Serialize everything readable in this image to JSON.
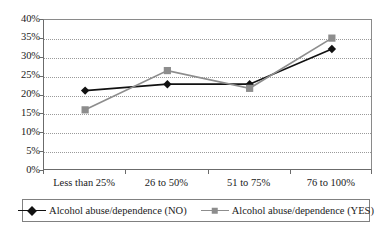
{
  "chart_data": {
    "type": "line",
    "title": "",
    "subtitle": "",
    "xlabel": "",
    "ylabel": "",
    "categories": [
      "Less than 25%",
      "26 to 50%",
      "51 to 75%",
      "76 to 100%"
    ],
    "ylim": [
      0,
      40
    ],
    "ytick_step": 5,
    "ytick_labels": [
      "0%",
      "5%",
      "10%",
      "15%",
      "20%",
      "25%",
      "30%",
      "35%",
      "40%"
    ],
    "ytick_values": [
      0,
      5,
      10,
      15,
      20,
      25,
      30,
      35,
      40
    ],
    "grid": true,
    "grid_style": "dotted-horizontal",
    "legend_position": "bottom",
    "value_unit": "%",
    "series": [
      {
        "name": "Alcohol abuse/dependence (NO)",
        "marker": "diamond",
        "color": "#111111",
        "values": [
          21.3,
          23.0,
          23.0,
          32.3
        ]
      },
      {
        "name": "Alcohol abuse/dependence (YES)",
        "marker": "square",
        "color": "#8d8d8d",
        "values": [
          16.2,
          26.6,
          21.9,
          35.2
        ]
      }
    ]
  },
  "legend": {
    "items": [
      {
        "label": "Alcohol abuse/dependence (NO)",
        "marker": "diamond-marker",
        "color": "#111111"
      },
      {
        "label": "Alcohol abuse/dependence (YES)",
        "marker": "square-marker",
        "color": "#8d8d8d"
      }
    ]
  },
  "caption": {
    "text": ""
  }
}
